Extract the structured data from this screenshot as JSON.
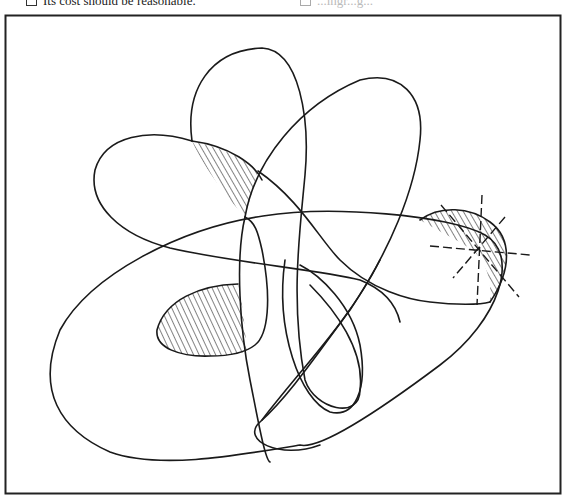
{
  "header": {
    "left_item": "Its cost should be reasonable.",
    "right_item": "...ingr...g..."
  },
  "figure": {
    "stroke_color": "#1a1a1a",
    "frame_color": "#222222",
    "hatched_regions": [
      {
        "id": "upper-wedge",
        "label": "upper-left hatched wedge"
      },
      {
        "id": "center-left-lobe",
        "label": "left hatched lobe"
      },
      {
        "id": "right-crescent",
        "label": "right hatched crescent with dashed burst"
      }
    ]
  }
}
